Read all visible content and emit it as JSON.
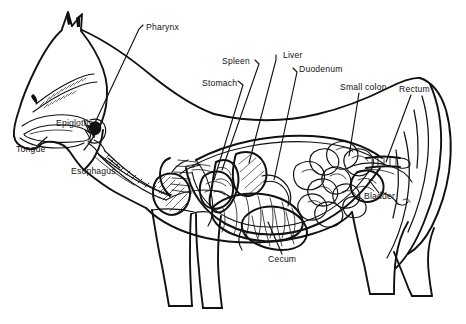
{
  "figure": {
    "view": "left lateral cutaway",
    "background_color": "#ffffff",
    "line_color": "#111111",
    "width": 466,
    "height": 324
  },
  "labels": [
    {
      "id": "pharynx",
      "text": "Pharynx",
      "x": 146,
      "y": 28,
      "anchor": "left"
    },
    {
      "id": "spleen",
      "text": "Spleen",
      "x": 222,
      "y": 62,
      "anchor": "left"
    },
    {
      "id": "liver",
      "text": "Liver",
      "x": 283,
      "y": 56,
      "anchor": "left"
    },
    {
      "id": "duodenum",
      "text": "Duodenum",
      "x": 299,
      "y": 70,
      "anchor": "left"
    },
    {
      "id": "stomach",
      "text": "Stomach",
      "x": 202,
      "y": 84,
      "anchor": "left"
    },
    {
      "id": "small-colon",
      "text": "Small colon",
      "x": 340,
      "y": 88,
      "anchor": "left"
    },
    {
      "id": "rectum",
      "text": "Rectum",
      "x": 399,
      "y": 90,
      "anchor": "left"
    },
    {
      "id": "epiglottis",
      "text": "Epiglottis",
      "x": 56,
      "y": 124,
      "anchor": "left"
    },
    {
      "id": "tongue",
      "text": "Tongue",
      "x": 16,
      "y": 150,
      "anchor": "left"
    },
    {
      "id": "esophagus",
      "text": "Esophagus",
      "x": 71,
      "y": 172,
      "anchor": "left"
    },
    {
      "id": "bladder",
      "text": "Bladder",
      "x": 364,
      "y": 197,
      "anchor": "left"
    },
    {
      "id": "cecum",
      "text": "Cecum",
      "x": 268,
      "y": 260,
      "anchor": "left"
    }
  ],
  "organ_parts": [
    "pharynx",
    "epiglottis",
    "tongue",
    "esophagus",
    "stomach",
    "spleen",
    "liver",
    "duodenum",
    "small intestine",
    "cecum",
    "large colon",
    "small colon",
    "rectum",
    "bladder",
    "heart",
    "lung",
    "trachea"
  ]
}
